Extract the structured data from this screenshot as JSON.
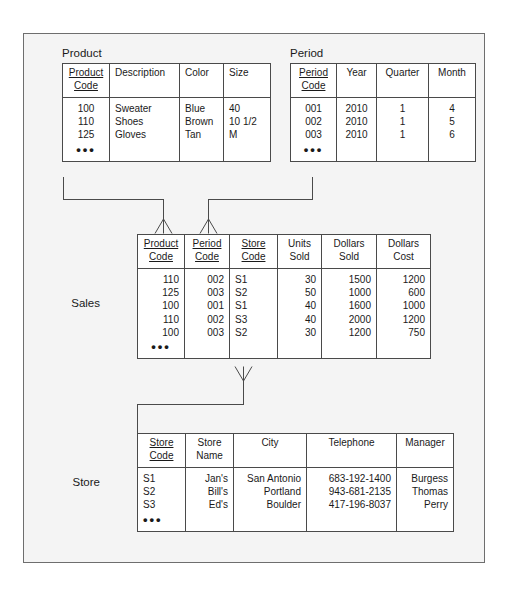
{
  "diagram": {
    "title_note": "Star schema: Sales fact table with Product, Period and Store dimension tables",
    "frame_color": "#6e6e6e",
    "line_color": "#4a4a4a",
    "background": "#f4f4f4"
  },
  "entities": {
    "product": {
      "label": "Product",
      "columns": [
        {
          "name": "product-code",
          "line1": "Product",
          "line2": "Code",
          "pk": true,
          "align": "c"
        },
        {
          "name": "description",
          "line1": "Description",
          "line2": "",
          "pk": false,
          "align": "l"
        },
        {
          "name": "color",
          "line1": "Color",
          "line2": "",
          "pk": false,
          "align": "l"
        },
        {
          "name": "size",
          "line1": "Size",
          "line2": "",
          "pk": false,
          "align": "l"
        }
      ],
      "rows": [
        [
          "100",
          "Sweater",
          "Blue",
          "40"
        ],
        [
          "110",
          "Shoes",
          "Brown",
          "10 1/2"
        ],
        [
          "125",
          "Gloves",
          "Tan",
          "M"
        ]
      ],
      "ellipsis": "•••"
    },
    "period": {
      "label": "Period",
      "columns": [
        {
          "name": "period-code",
          "line1": "Period",
          "line2": "Code",
          "pk": true,
          "align": "c"
        },
        {
          "name": "year",
          "line1": "Year",
          "line2": "",
          "pk": false,
          "align": "c"
        },
        {
          "name": "quarter",
          "line1": "Quarter",
          "line2": "",
          "pk": false,
          "align": "c"
        },
        {
          "name": "month",
          "line1": "Month",
          "line2": "",
          "pk": false,
          "align": "c"
        }
      ],
      "rows": [
        [
          "001",
          "2010",
          "1",
          "4"
        ],
        [
          "002",
          "2010",
          "1",
          "5"
        ],
        [
          "003",
          "2010",
          "1",
          "6"
        ]
      ],
      "ellipsis": "•••"
    },
    "sales": {
      "label": "Sales",
      "columns": [
        {
          "name": "product-code",
          "line1": "Product",
          "line2": "Code",
          "pk": true,
          "align": "r"
        },
        {
          "name": "period-code",
          "line1": "Period",
          "line2": "Code",
          "pk": true,
          "align": "r"
        },
        {
          "name": "store-code",
          "line1": "Store",
          "line2": "Code",
          "pk": true,
          "align": "l"
        },
        {
          "name": "units-sold",
          "line1": "Units",
          "line2": "Sold",
          "pk": false,
          "align": "r"
        },
        {
          "name": "dollars-sold",
          "line1": "Dollars",
          "line2": "Sold",
          "pk": false,
          "align": "r"
        },
        {
          "name": "dollars-cost",
          "line1": "Dollars",
          "line2": "Cost",
          "pk": false,
          "align": "r"
        }
      ],
      "rows": [
        [
          "110",
          "002",
          "S1",
          "30",
          "1500",
          "1200"
        ],
        [
          "125",
          "003",
          "S2",
          "50",
          "1000",
          "600"
        ],
        [
          "100",
          "001",
          "S1",
          "40",
          "1600",
          "1000"
        ],
        [
          "110",
          "002",
          "S3",
          "40",
          "2000",
          "1200"
        ],
        [
          "100",
          "003",
          "S2",
          "30",
          "1200",
          "750"
        ]
      ],
      "ellipsis": "•••"
    },
    "store": {
      "label": "Store",
      "columns": [
        {
          "name": "store-code",
          "line1": "Store",
          "line2": "Code",
          "pk": true,
          "align": "l"
        },
        {
          "name": "store-name",
          "line1": "Store",
          "line2": "Name",
          "pk": false,
          "align": "r"
        },
        {
          "name": "city",
          "line1": "City",
          "line2": "",
          "pk": false,
          "align": "r"
        },
        {
          "name": "telephone",
          "line1": "Telephone",
          "line2": "",
          "pk": false,
          "align": "r"
        },
        {
          "name": "manager",
          "line1": "Manager",
          "line2": "",
          "pk": false,
          "align": "r"
        }
      ],
      "rows": [
        [
          "S1",
          "Jan's",
          "San Antonio",
          "683-192-1400",
          "Burgess"
        ],
        [
          "S2",
          "Bill's",
          "Portland",
          "943-681-2135",
          "Thomas"
        ],
        [
          "S3",
          "Ed's",
          "Boulder",
          "417-196-8037",
          "Perry"
        ]
      ],
      "ellipsis": "•••"
    }
  },
  "relationships": [
    {
      "name": "product-to-sales",
      "from": "Product",
      "to": "Sales",
      "cardinality": "one-to-many"
    },
    {
      "name": "period-to-sales",
      "from": "Period",
      "to": "Sales",
      "cardinality": "one-to-many"
    },
    {
      "name": "store-to-sales",
      "from": "Sales",
      "to": "Store",
      "cardinality": "many-to-one"
    }
  ]
}
